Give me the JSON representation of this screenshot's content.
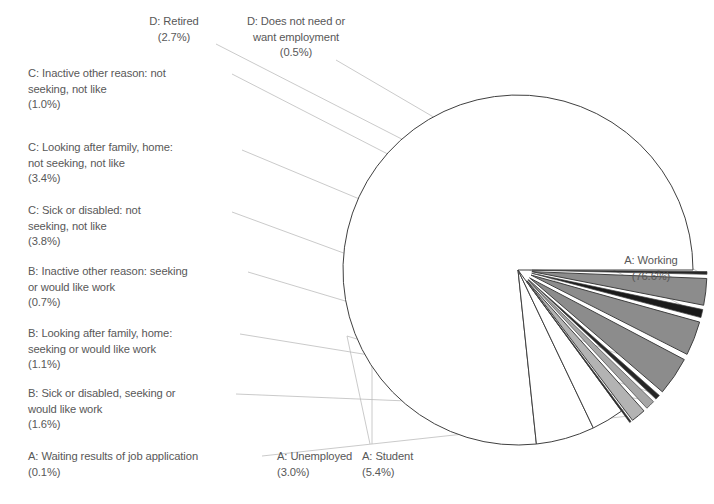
{
  "chart_data": {
    "type": "pie",
    "title": "",
    "subtitle": "",
    "xlabel": "",
    "ylabel": "",
    "legend_position": "callout-labels",
    "grid": false,
    "units": "percent",
    "total": 100.0,
    "categories": [
      "A: Working",
      "A: Student",
      "A: Unemployed",
      "A: Waiting results of job application",
      "B: Sick or disabled, seeking or would like work",
      "B: Looking after family, home: seeking or would like work",
      "B: Inactive other reason: seeking or would like work",
      "C: Sick or disabled: not seeking, not like",
      "C: Looking after family, home: not seeking, not like",
      "C: Inactive other reason: not seeking, not like",
      "D: Retired",
      "D: Does not need or want employment"
    ],
    "values": [
      76.6,
      5.4,
      3.0,
      0.1,
      1.6,
      1.1,
      0.7,
      3.8,
      3.4,
      1.0,
      2.7,
      0.5
    ],
    "value_labels": [
      "(76.6%)",
      "(5.4%)",
      "(3.0%)",
      "(0.1%)",
      "(1.6%)",
      "(1.1%)",
      "(0.7%)",
      "(3.8%)",
      "(3.4%)",
      "(1.0%)",
      "(2.7%)",
      "(0.5%)"
    ],
    "slice_colors": [
      "#ffffff",
      "#ffffff",
      "#ffffff",
      "#262626",
      "#b3b3b3",
      "#a6a6a6",
      "#262626",
      "#8c8c8c",
      "#8c8c8c",
      "#1a1a1a",
      "#8c8c8c",
      "#262626"
    ],
    "exploded": [
      false,
      false,
      false,
      true,
      true,
      true,
      true,
      true,
      true,
      true,
      true,
      true
    ],
    "stroke_color": "#404040",
    "label_color": "#585858"
  },
  "labels": [
    {
      "id": "d-retired",
      "name": "label-d-retired",
      "text": "D: Retired\n(2.7%)",
      "align": "center",
      "x": 104,
      "y": 14,
      "w": 140
    },
    {
      "id": "d-does-not-need",
      "name": "label-d-does-not-need-or-want-employment",
      "text": "D: Does not need or\nwant employment\n(0.5%)",
      "align": "center",
      "x": 222,
      "y": 14,
      "w": 148
    },
    {
      "id": "c-inactive-other",
      "name": "label-c-inactive-other-reason",
      "text": "C: Inactive other reason: not\nseeking, not like\n(1.0%)",
      "align": "left",
      "x": 28,
      "y": 66,
      "w": 200
    },
    {
      "id": "c-looking-after-family",
      "name": "label-c-looking-after-family-home",
      "text": "C: Looking after family, home:\nnot seeking, not like\n(3.4%)",
      "align": "left",
      "x": 28,
      "y": 140,
      "w": 210
    },
    {
      "id": "c-sick-or-disabled",
      "name": "label-c-sick-or-disabled",
      "text": "C: Sick or disabled: not\nseeking, not like\n(3.8%)",
      "align": "left",
      "x": 28,
      "y": 203,
      "w": 200
    },
    {
      "id": "b-inactive-other",
      "name": "label-b-inactive-other-reason",
      "text": "B: Inactive other reason: seeking\nor would like work\n(0.7%)",
      "align": "left",
      "x": 28,
      "y": 264,
      "w": 215
    },
    {
      "id": "b-looking-after-family",
      "name": "label-b-looking-after-family-home",
      "text": "B: Looking after family, home:\nseeking or would like work\n(1.1%)",
      "align": "left",
      "x": 28,
      "y": 326,
      "w": 210
    },
    {
      "id": "b-sick-or-disabled",
      "name": "label-b-sick-or-disabled",
      "text": "B: Sick or disabled, seeking or\nwould like work\n(1.6%)",
      "align": "left",
      "x": 28,
      "y": 386,
      "w": 205
    },
    {
      "id": "a-waiting-results",
      "name": "label-a-waiting-results-of-job-application",
      "text": "A: Waiting results of job application\n(0.1%)",
      "align": "left",
      "x": 28,
      "y": 449,
      "w": 230
    },
    {
      "id": "a-unemployed",
      "name": "label-a-unemployed",
      "text": "A: Unemployed\n(3.0%)",
      "align": "left",
      "x": 277,
      "y": 449,
      "w": 110
    },
    {
      "id": "a-student",
      "name": "label-a-student",
      "text": "A: Student\n(5.4%)",
      "align": "left",
      "x": 362,
      "y": 449,
      "w": 95
    },
    {
      "id": "a-working",
      "name": "label-a-working",
      "text": "A: Working\n(76.6%)",
      "align": "center",
      "x": 604,
      "y": 253,
      "w": 94
    }
  ]
}
